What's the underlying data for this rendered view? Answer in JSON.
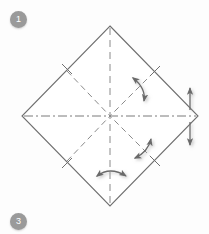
{
  "figure": {
    "type": "origami-fold-diagram",
    "shape": "square rotated 45 degrees (diamond)"
  },
  "steps": [
    {
      "id": "step-1",
      "number": "1",
      "position": "top-left"
    },
    {
      "id": "step-3",
      "number": "3",
      "position": "bottom-left"
    }
  ],
  "colors": {
    "outline": "#6f6f6f",
    "crease": "#8a8a8a",
    "centerline": "#7a7a7a",
    "arrow": "#6a6a6a",
    "badge_bg": "#9a9a9a",
    "badge_text": "#ffffff",
    "background": "#fdfdfd"
  },
  "geometry": {
    "center": {
      "x": 110,
      "y": 116
    },
    "vertices": {
      "top": {
        "x": 110,
        "y": 26
      },
      "right": {
        "x": 198,
        "y": 116
      },
      "bottom": {
        "x": 110,
        "y": 206
      },
      "left": {
        "x": 22,
        "y": 116
      }
    },
    "half_diagonal": 90
  },
  "creases": [
    {
      "name": "vertical-crease",
      "style": "dashed",
      "from": "top",
      "to": "bottom"
    },
    {
      "name": "horizontal-crease",
      "style": "dash-dot",
      "from": "left",
      "to": "right"
    },
    {
      "name": "diagonal-crease-nw",
      "style": "dashed",
      "from": "upper-left-edge",
      "to": "center"
    },
    {
      "name": "diagonal-crease-ne",
      "style": "dashed",
      "from": "upper-right-edge",
      "to": "center"
    },
    {
      "name": "diagonal-crease-sw",
      "style": "dashed",
      "from": "lower-left-edge",
      "to": "center"
    },
    {
      "name": "diagonal-crease-se",
      "style": "dashed",
      "from": "lower-right-edge",
      "to": "center"
    }
  ],
  "tick_marks": [
    {
      "name": "tick-nw",
      "x": 68,
      "y": 71
    },
    {
      "name": "tick-ne",
      "x": 155,
      "y": 73
    },
    {
      "name": "tick-sw",
      "x": 68,
      "y": 161
    },
    {
      "name": "tick-se",
      "x": 155,
      "y": 160
    }
  ],
  "arrows": [
    {
      "name": "fold-arrow-upper-right",
      "kind": "curved-double-headed",
      "orientation": "diagonal-nw-se",
      "meaning": "fold edge to center and back"
    },
    {
      "name": "fold-arrow-lower-right",
      "kind": "curved-double-headed",
      "orientation": "diagonal-sw-ne",
      "meaning": "fold edge to center and back"
    },
    {
      "name": "fold-arrow-bottom",
      "kind": "curved-double-headed",
      "orientation": "horizontal",
      "meaning": "fold left-right across vertical crease"
    },
    {
      "name": "fold-arrow-right-edge",
      "kind": "straight-double-headed",
      "orientation": "vertical",
      "meaning": "fold up and down at right corner"
    }
  ]
}
